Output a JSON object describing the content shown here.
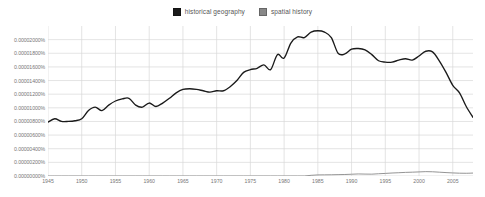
{
  "legend": {
    "items": [
      {
        "label": "historical geography",
        "color": "#1a1a1a",
        "swatch_name": "legend-swatch-historical-geography"
      },
      {
        "label": "spatial history",
        "color": "#888888",
        "swatch_name": "legend-swatch-spatial-history"
      }
    ]
  },
  "axes": {
    "y_tick_labels": [
      "0.00002000%",
      "0.00001800%",
      "0.00001600%",
      "0.00001400%",
      "0.00001200%",
      "0.00001000%",
      "0.00000800%",
      "0.00000600%",
      "0.00000400%",
      "0.00000200%",
      "0.00000000%"
    ],
    "x_tick_labels": [
      "1945",
      "1950",
      "1955",
      "1960",
      "1965",
      "1970",
      "1975",
      "1980",
      "1985",
      "1990",
      "1995",
      "2000",
      "2005"
    ]
  },
  "colors": {
    "series_1": "#1a1a1a",
    "series_2": "#888888",
    "grid": "#d9d9d9",
    "axis_text": "#777777",
    "background": "#ffffff"
  },
  "chart_data": {
    "type": "line",
    "title": "",
    "xlabel": "",
    "ylabel": "",
    "xlim": [
      1945,
      2008
    ],
    "ylim": [
      0.0,
      2.2e-05
    ],
    "ytick_values": [
      2e-05,
      1.8e-05,
      1.6e-05,
      1.4e-05,
      1.2e-05,
      1e-05,
      8e-06,
      6e-06,
      4e-06,
      2e-06,
      0.0
    ],
    "xtick_values": [
      1945,
      1950,
      1955,
      1960,
      1965,
      1970,
      1975,
      1980,
      1985,
      1990,
      1995,
      2000,
      2005
    ],
    "grid": true,
    "legend_position": "top-center",
    "x": [
      1945,
      1946,
      1947,
      1948,
      1949,
      1950,
      1951,
      1952,
      1953,
      1954,
      1955,
      1956,
      1957,
      1958,
      1959,
      1960,
      1961,
      1962,
      1963,
      1964,
      1965,
      1966,
      1967,
      1968,
      1969,
      1970,
      1971,
      1972,
      1973,
      1974,
      1975,
      1976,
      1977,
      1978,
      1979,
      1980,
      1981,
      1982,
      1983,
      1984,
      1985,
      1986,
      1987,
      1988,
      1989,
      1990,
      1991,
      1992,
      1993,
      1994,
      1995,
      1996,
      1997,
      1998,
      1999,
      2000,
      2001,
      2002,
      2003,
      2004,
      2005,
      2006,
      2007,
      2008
    ],
    "series": [
      {
        "name": "historical geography",
        "color": "#1a1a1a",
        "values": [
          7.9e-06,
          8.4e-06,
          8e-06,
          8e-06,
          8.1e-06,
          8.4e-06,
          9.6e-06,
          1.01e-05,
          9.6e-06,
          1.04e-05,
          1.1e-05,
          1.13e-05,
          1.14e-05,
          1.04e-05,
          1.01e-05,
          1.07e-05,
          1.02e-05,
          1.07e-05,
          1.14e-05,
          1.22e-05,
          1.27e-05,
          1.28e-05,
          1.27e-05,
          1.25e-05,
          1.23e-05,
          1.25e-05,
          1.25e-05,
          1.31e-05,
          1.4e-05,
          1.52e-05,
          1.56e-05,
          1.58e-05,
          1.63e-05,
          1.56e-05,
          1.78e-05,
          1.73e-05,
          1.95e-05,
          2.04e-05,
          2.03e-05,
          2.11e-05,
          2.13e-05,
          2.11e-05,
          2.03e-05,
          1.8e-05,
          1.79e-05,
          1.86e-05,
          1.87e-05,
          1.85e-05,
          1.78e-05,
          1.69e-05,
          1.67e-05,
          1.67e-05,
          1.7e-05,
          1.72e-05,
          1.7e-05,
          1.76e-05,
          1.83e-05,
          1.82e-05,
          1.69e-05,
          1.52e-05,
          1.33e-05,
          1.22e-05,
          1.02e-05,
          8.6e-06
        ]
      },
      {
        "name": "spatial history",
        "color": "#888888",
        "values": [
          0.0,
          0.0,
          0.0,
          0.0,
          0.0,
          0.0,
          0.0,
          0.0,
          0.0,
          0.0,
          0.0,
          0.0,
          0.0,
          0.0,
          0.0,
          0.0,
          0.0,
          0.0,
          0.0,
          0.0,
          0.0,
          0.0,
          0.0,
          0.0,
          0.0,
          0.0,
          0.0,
          0.0,
          0.0,
          0.0,
          0.0,
          0.0,
          0.0,
          0.0,
          0.0,
          0.0,
          0.0,
          0.0,
          0.0,
          1e-07,
          1.6e-07,
          1.7e-07,
          1.8e-07,
          2e-07,
          2.2e-07,
          2.6e-07,
          3e-07,
          2.8e-07,
          2.7e-07,
          3.3e-07,
          3.8e-07,
          4.4e-07,
          4.8e-07,
          5.3e-07,
          5.6e-07,
          6e-07,
          6.4e-07,
          6.2e-07,
          5.6e-07,
          5e-07,
          4.5e-07,
          4.1e-07,
          4e-07,
          4.3e-07
        ]
      }
    ]
  }
}
